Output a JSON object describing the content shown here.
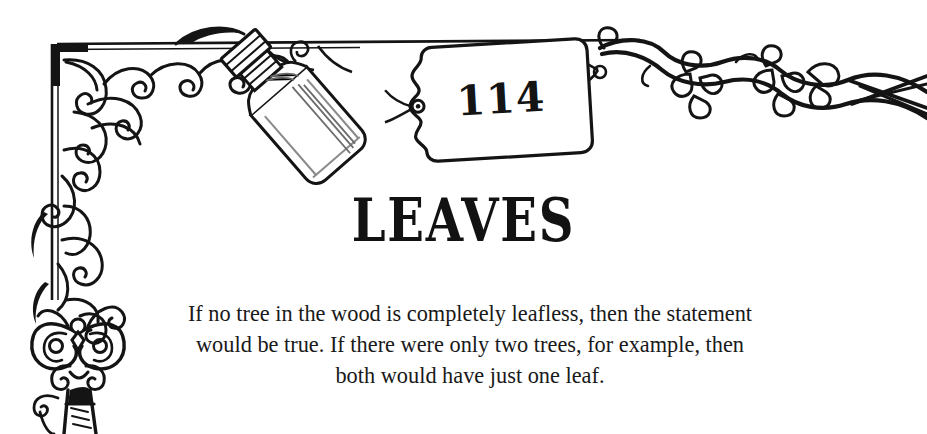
{
  "page": {
    "background_color": "#ffffff",
    "ink_color": "#141414",
    "number_tag": {
      "value": "114",
      "shape": "hanging-label-tag"
    },
    "title": "LEAVES",
    "body_lines": [
      "If no tree in the wood is completely leafless, then the statement",
      "would be true. If there were only two trees, for example, then",
      "both would have just one leaf."
    ],
    "decorations": {
      "corner_flourish": "scroll-curl-corner-ornament",
      "top_border_rule": "horizontal-double-rule",
      "left_border_rule": "vertical-double-rule",
      "key": "ornate-skeleton-key",
      "bottle": "tilted-corked-glass-bottle",
      "vine": "leafy-twisting-branch",
      "string": "hanging-string"
    }
  }
}
